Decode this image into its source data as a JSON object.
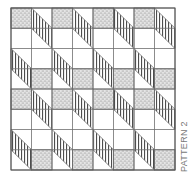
{
  "title": "PATTERN 2",
  "grid": {
    "x0": 11,
    "y0": 8,
    "cell_w": 20.5,
    "cell_h": 20.25,
    "cols": 8,
    "rows": 8
  },
  "colors": {
    "line": "#6e6e6e",
    "stipple_bg": "#e6e6e6",
    "stipple_dot": "#6a6a6a",
    "stripe": "#4d4d4d",
    "background": "#ffffff"
  },
  "stipple_squares": [
    {
      "row": 0,
      "cols": [
        0,
        2,
        4,
        6
      ]
    },
    {
      "row": 3,
      "cols": [
        1,
        3,
        5,
        7
      ]
    },
    {
      "row": 4,
      "cols": [
        0,
        2,
        4,
        6
      ]
    },
    {
      "row": 7,
      "cols": [
        1,
        3,
        5,
        7
      ]
    }
  ],
  "stripe_parallelograms": [
    {
      "start_row": 0,
      "cols": [
        1,
        3,
        5,
        7
      ]
    },
    {
      "start_row": 2,
      "cols": [
        0,
        2,
        4,
        6
      ]
    },
    {
      "start_row": 4,
      "cols": [
        1,
        3,
        5,
        7
      ]
    },
    {
      "start_row": 6,
      "cols": [
        0,
        2,
        4,
        6
      ]
    }
  ]
}
